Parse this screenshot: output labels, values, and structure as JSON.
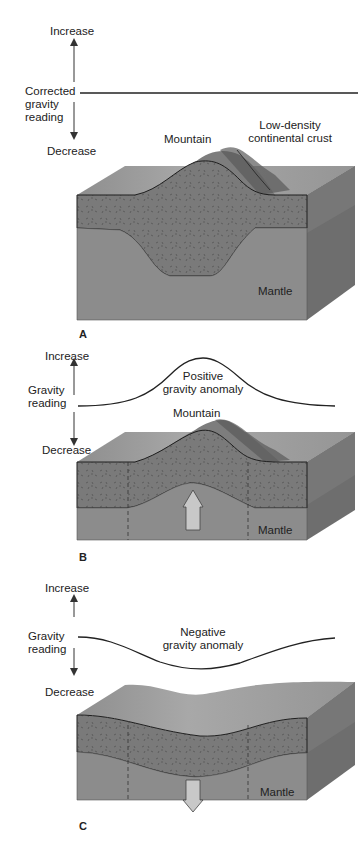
{
  "panels": [
    {
      "id": "A",
      "letter": "A",
      "axis": {
        "increase": "Increase",
        "reading_line1": "Corrected",
        "reading_line2": "gravity",
        "reading_line3": "reading",
        "decrease": "Decrease"
      },
      "curve": "flat",
      "labels": {
        "mountain": "Mountain",
        "crust_line1": "Low-density",
        "crust_line2": "continental crust",
        "mantle": "Mantle"
      }
    },
    {
      "id": "B",
      "letter": "B",
      "axis": {
        "increase": "Increase",
        "reading_line1": "Gravity",
        "reading_line2": "reading",
        "decrease": "Decrease"
      },
      "curve": "positive-peak",
      "labels": {
        "anomaly_line1": "Positive",
        "anomaly_line2": "gravity anomaly",
        "mountain": "Mountain",
        "mantle": "Mantle"
      },
      "arrow": "up"
    },
    {
      "id": "C",
      "letter": "C",
      "axis": {
        "increase": "Increase",
        "reading_line1": "Gravity",
        "reading_line2": "reading",
        "decrease": "Decrease"
      },
      "curve": "negative-trough",
      "labels": {
        "anomaly_line1": "Negative",
        "anomaly_line2": "gravity anomaly",
        "mantle": "Mantle"
      },
      "arrow": "down"
    }
  ],
  "colors": {
    "mantle_front": "#8c8c8c",
    "crust_front": "#7a7a7a",
    "top_surface": "#9a9a9a",
    "side_face": "#6e6e6e",
    "line": "#1e1e1e",
    "arrow_fill": "#c8c8c8"
  }
}
